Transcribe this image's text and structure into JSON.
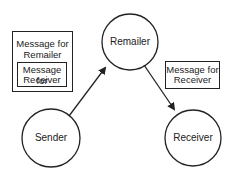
{
  "nodes": {
    "remailer": {
      "label": "Remailer"
    },
    "sender": {
      "label": "Sender"
    },
    "receiver": {
      "label": "Receiver"
    }
  },
  "boxes": {
    "outer_message": {
      "line1": "Message for",
      "line2": "Remailer"
    },
    "inner_message": {
      "line1": "Message for",
      "line2": "Receiver"
    },
    "right_message": {
      "line1": "Message for",
      "line2": "Receiver"
    }
  },
  "edges": [
    {
      "from": "Sender",
      "to": "Remailer"
    },
    {
      "from": "Remailer",
      "to": "Receiver"
    }
  ],
  "colors": {
    "stroke": "#222222",
    "background": "#ffffff"
  }
}
